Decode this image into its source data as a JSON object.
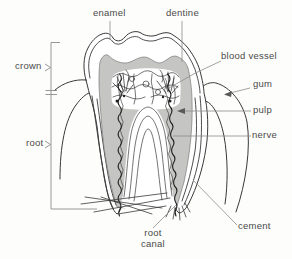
{
  "labels": {
    "enamel": "enamel",
    "dentine": "dentine",
    "blood_vessel": "blood vessel",
    "gum": "gum",
    "pulp": "pulp",
    "nerve": "nerve",
    "cement": "cement",
    "root_canal_line1": "root",
    "root_canal_line2": "canal",
    "crown": "crown",
    "root": "root"
  },
  "colors": {
    "background": "#fdfdfb",
    "outline": "#383838",
    "leader_line": "#8c8c8c",
    "dentine_fill": "#c5c5c3",
    "text": "#4a4a4a"
  }
}
